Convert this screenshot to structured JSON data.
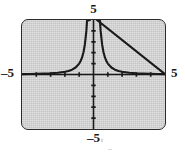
{
  "figure": {
    "kind": "graphing-calculator-screen",
    "screen_color": "#c4c4c4",
    "border_color": "#2b2b2b",
    "curve_color": "#1a1a1a"
  },
  "labels": {
    "top": "5",
    "bottom": "–5",
    "left": "–5",
    "right": "5"
  },
  "chart_data": {
    "type": "line",
    "title": "",
    "xlabel": "",
    "ylabel": "",
    "xlim": [
      -5,
      5
    ],
    "ylim": [
      -5,
      5
    ],
    "grid": false,
    "legend": "none",
    "x_tick_labels": [
      "–5",
      "5"
    ],
    "y_tick_labels": [
      "5",
      "–5"
    ],
    "x_ticks": [
      -4,
      -3,
      -2,
      -1,
      1,
      2,
      3,
      4
    ],
    "y_ticks": [
      -4,
      -3,
      -2,
      -1,
      1,
      2,
      3,
      4
    ],
    "tick_interval": 1,
    "axes_shown": [
      "x-axis",
      "y-axis"
    ],
    "asymptotes": {
      "vertical": [
        0
      ],
      "horizontal": [
        0
      ]
    },
    "series": [
      {
        "name": "y = 1/x²",
        "expression": "1/x^2",
        "branch": "left",
        "x": [
          -5.0,
          -4.5,
          -4.0,
          -3.5,
          -3.0,
          -2.5,
          -2.0,
          -1.75,
          -1.5,
          -1.25,
          -1.0,
          -0.9,
          -0.8,
          -0.7,
          -0.6,
          -0.5,
          -0.45,
          -0.4,
          -0.35,
          -0.3
        ],
        "y": [
          0.04,
          0.049,
          0.063,
          0.082,
          0.111,
          0.16,
          0.25,
          0.327,
          0.444,
          0.64,
          1.0,
          1.235,
          1.563,
          2.041,
          2.778,
          4.0,
          4.938,
          6.25,
          8.163,
          11.111
        ]
      },
      {
        "name": "y = 1/x²",
        "expression": "1/x^2",
        "branch": "right",
        "x": [
          0.3,
          0.35,
          0.4,
          0.45,
          0.5,
          0.6,
          0.7,
          0.8,
          0.9,
          1.0,
          1.25,
          1.5,
          1.75,
          2.0,
          2.5,
          3.0,
          3.5,
          4.0,
          4.5,
          5.0
        ],
        "y": [
          11.111,
          8.163,
          6.25,
          4.938,
          4.0,
          2.778,
          2.041,
          1.563,
          1.235,
          1.0,
          0.64,
          0.444,
          0.327,
          0.25,
          0.16,
          0.111,
          0.082,
          0.063,
          0.049,
          0.04
        ]
      }
    ]
  }
}
